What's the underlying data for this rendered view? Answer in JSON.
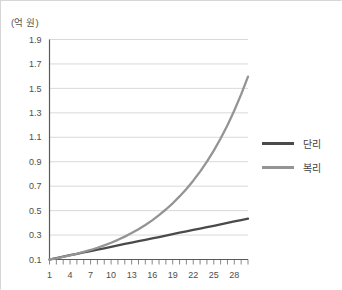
{
  "chart_data": {
    "type": "line",
    "title": "",
    "subtitle": "",
    "xlabel": "",
    "ylabel": "",
    "y_unit_caption": "(억 원)",
    "x": [
      1,
      2,
      3,
      4,
      5,
      6,
      7,
      8,
      9,
      10,
      11,
      12,
      13,
      14,
      15,
      16,
      17,
      18,
      19,
      20,
      21,
      22,
      23,
      24,
      25,
      26,
      27,
      28,
      29,
      30
    ],
    "xlim": [
      1,
      30
    ],
    "ylim": [
      0.1,
      1.9
    ],
    "xticks": [
      1,
      4,
      7,
      10,
      13,
      16,
      19,
      22,
      25,
      28
    ],
    "xtick_labels": [
      "1",
      "4",
      "7",
      "10",
      "13",
      "16",
      "19",
      "22",
      "25",
      "28"
    ],
    "yticks": [
      0.1,
      0.3,
      0.5,
      0.7,
      0.9,
      1.1,
      1.3,
      1.5,
      1.7,
      1.9
    ],
    "ytick_labels": [
      "0.1",
      "0.3",
      "0.5",
      "0.7",
      "0.9",
      "1.1",
      "1.3",
      "1.5",
      "1.7",
      "1.9"
    ],
    "grid": true,
    "grid_axis": "y",
    "legend_position": "right",
    "series": [
      {
        "name": "단리",
        "color": "#4a4a4a",
        "width": 2.3,
        "values": [
          0.1,
          0.112,
          0.123,
          0.135,
          0.146,
          0.158,
          0.169,
          0.181,
          0.192,
          0.204,
          0.215,
          0.227,
          0.238,
          0.25,
          0.261,
          0.273,
          0.284,
          0.296,
          0.307,
          0.319,
          0.33,
          0.342,
          0.353,
          0.365,
          0.376,
          0.388,
          0.399,
          0.411,
          0.422,
          0.434
        ]
      },
      {
        "name": "복리",
        "color": "#949494",
        "width": 2.3,
        "values": [
          0.1,
          0.11,
          0.122,
          0.134,
          0.147,
          0.162,
          0.178,
          0.196,
          0.216,
          0.237,
          0.261,
          0.287,
          0.316,
          0.348,
          0.382,
          0.42,
          0.463,
          0.509,
          0.56,
          0.616,
          0.677,
          0.745,
          0.819,
          0.901,
          0.991,
          1.09,
          1.199,
          1.319,
          1.451,
          1.596
        ]
      }
    ]
  },
  "legend": {
    "items": [
      {
        "label": "단리",
        "color": "#4a4a4a"
      },
      {
        "label": "복리",
        "color": "#949494"
      }
    ]
  }
}
